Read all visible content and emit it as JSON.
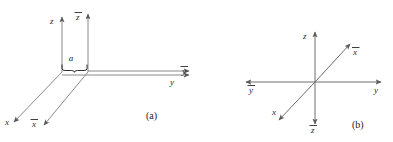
{
  "figure": {
    "type": "diagram",
    "panels": [
      {
        "id": "a",
        "caption": "(a)",
        "axes": [
          {
            "name": "z",
            "label": "z",
            "overbar": false,
            "direction": "up",
            "origin": "unbarred"
          },
          {
            "name": "zbar",
            "label": "z",
            "overbar": true,
            "direction": "up",
            "origin": "barred"
          },
          {
            "name": "y",
            "label": "y",
            "overbar": false,
            "direction": "right",
            "origin": "unbarred"
          },
          {
            "name": "ybar",
            "label": "y",
            "overbar": true,
            "direction": "right",
            "origin": "barred"
          },
          {
            "name": "x",
            "label": "x",
            "overbar": false,
            "direction": "down-left",
            "origin": "unbarred"
          },
          {
            "name": "xbar",
            "label": "x",
            "overbar": true,
            "direction": "down-left",
            "origin": "barred"
          }
        ],
        "annotations": [
          {
            "name": "separation-brace",
            "label": "a",
            "italic": true,
            "meaning": "offset distance between the two origins along y"
          }
        ]
      },
      {
        "id": "b",
        "caption": "(b)",
        "axes": [
          {
            "name": "z",
            "label": "z",
            "overbar": false,
            "direction": "up"
          },
          {
            "name": "zbar",
            "label": "z",
            "overbar": true,
            "direction": "down"
          },
          {
            "name": "y",
            "label": "y",
            "overbar": false,
            "direction": "right"
          },
          {
            "name": "ybar",
            "label": "y",
            "overbar": true,
            "direction": "left"
          },
          {
            "name": "xbar",
            "label": "x",
            "overbar": true,
            "direction": "up-right"
          },
          {
            "name": "x",
            "label": "x",
            "overbar": false,
            "direction": "down-left"
          }
        ],
        "annotations": []
      }
    ],
    "colors": {
      "background": "#ffffff",
      "axis": "#8a8a8a",
      "axis_dark": "#6e6e6e",
      "text": "#1c1c1c",
      "label": "#2a2a2a"
    }
  }
}
